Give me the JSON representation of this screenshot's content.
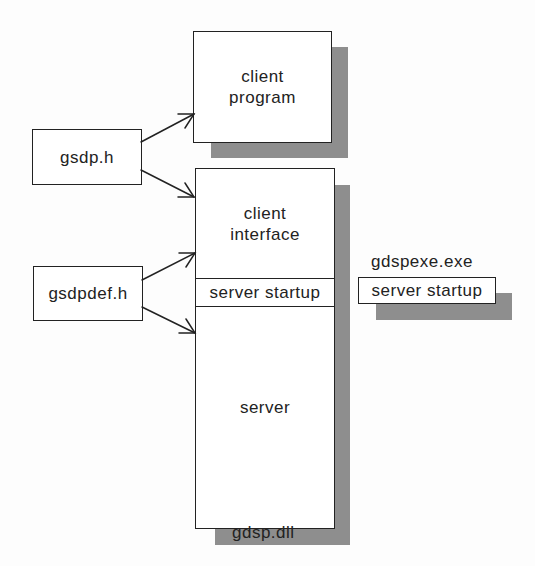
{
  "diagram": {
    "nodes": {
      "client_program": {
        "label_line1": "client",
        "label_line2": "program"
      },
      "gsdp_h": {
        "label": "gsdp.h"
      },
      "gsdpdef_h": {
        "label": "gsdpdef.h"
      },
      "dll": {
        "caption": "gdsp.dll",
        "sections": {
          "client_interface": {
            "label_line1": "client",
            "label_line2": "interface"
          },
          "server_startup": {
            "label": "server startup"
          },
          "server": {
            "label": "server"
          }
        }
      },
      "exe": {
        "caption": "gdspexe.exe",
        "server_startup": {
          "label": "server startup"
        }
      }
    },
    "edges": [
      {
        "from": "gsdp.h",
        "to": "client program"
      },
      {
        "from": "gsdp.h",
        "to": "client interface"
      },
      {
        "from": "gsdpdef.h",
        "to": "client interface"
      },
      {
        "from": "gsdpdef.h",
        "to": "server"
      }
    ],
    "colors": {
      "shadow": "#8e8e8e",
      "stroke": "#222222",
      "box_fill": "#ffffff"
    }
  }
}
